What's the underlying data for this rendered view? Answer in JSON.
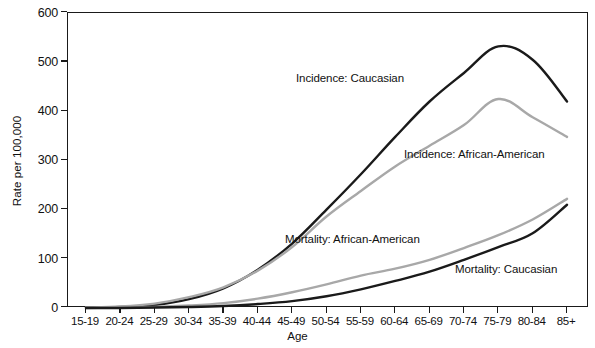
{
  "chart_data": {
    "type": "line",
    "title": "",
    "xlabel": "Age",
    "ylabel": "Rate per 100,000",
    "ylim": [
      0,
      600
    ],
    "yticks": [
      0,
      100,
      200,
      300,
      400,
      500,
      600
    ],
    "grid": false,
    "legend_position": "inline-annotations",
    "categories": [
      "15-19",
      "20-24",
      "25-29",
      "30-34",
      "35-39",
      "40-44",
      "45-49",
      "50-54",
      "55-59",
      "60-64",
      "65-69",
      "70-74",
      "75-79",
      "80-84",
      "85+"
    ],
    "series": [
      {
        "name": "Incidence: Caucasian",
        "color": "#1a1a1a",
        "values": [
          1,
          2,
          6,
          18,
          40,
          78,
          131,
          200,
          272,
          348,
          420,
          478,
          532,
          505,
          420
        ]
      },
      {
        "name": "Incidence: African-American",
        "color": "#a8a8a8",
        "values": [
          1,
          3,
          9,
          22,
          42,
          76,
          124,
          186,
          238,
          288,
          330,
          372,
          425,
          388,
          348
        ]
      },
      {
        "name": "Mortality: African-American",
        "color": "#a8a8a8",
        "values": [
          0,
          1,
          2,
          5,
          10,
          19,
          32,
          48,
          66,
          80,
          98,
          122,
          148,
          180,
          222
        ]
      },
      {
        "name": "Mortality: Caucasian",
        "color": "#1a1a1a",
        "values": [
          0,
          0,
          1,
          2,
          4,
          8,
          14,
          24,
          38,
          55,
          74,
          98,
          124,
          152,
          210
        ]
      }
    ],
    "annotations": [
      {
        "text": "Incidence: Caucasian",
        "x_px": 296,
        "y_px": 72
      },
      {
        "text": "Incidence: African-American",
        "x_px": 404,
        "y_px": 148
      },
      {
        "text": "Mortality: African-American",
        "x_px": 285,
        "y_px": 233
      },
      {
        "text": "Mortality: Caucasian",
        "x_px": 455,
        "y_px": 263
      }
    ]
  },
  "colors": {
    "axis": "#1a1a1a",
    "dark_series": "#1a1a1a",
    "light_series": "#a8a8a8",
    "background": "#ffffff"
  }
}
